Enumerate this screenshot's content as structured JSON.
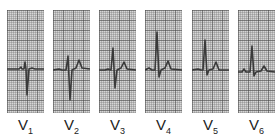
{
  "figure": {
    "leads": [
      {
        "id": "V1",
        "letter": "V",
        "number": "1",
        "x": 7,
        "trace": "M0 59 L12 59 L14 57 L15 59 L17 59 L18 52 L19 59 L20 85 L22 59 L25 58 L28 59 L37 59"
      },
      {
        "id": "V2",
        "letter": "V",
        "number": "2",
        "x": 53,
        "trace": "M0 60 L6 59 L9 60 L13 60 L15 46 L17 90 L19 60 L23 58 L26 50 L29 58 L37 59"
      },
      {
        "id": "V3",
        "letter": "V",
        "number": "3",
        "x": 99,
        "trace": "M0 60 L6 60 L9 59 L12 60 L14 38 L16 78 L18 60 L22 58 L25 52 L28 59 L37 60"
      },
      {
        "id": "V4",
        "letter": "V",
        "number": "4",
        "x": 145,
        "trace": "M0 60 L4 58 L7 60 L10 60 L12 22 L14 67 L16 60 L20 58 L23 51 L26 59 L37 60"
      },
      {
        "id": "V5",
        "letter": "V",
        "number": "5",
        "x": 192,
        "trace": "M0 60 L6 59 L9 60 L11 60 L13 30 L15 65 L17 60 L21 59 L24 52 L27 60 L37 60"
      },
      {
        "id": "V6",
        "letter": "V",
        "number": "6",
        "x": 238,
        "trace": "M0 62 L4 62 L6 59 L8 62 L12 62 L14 36 L16 66 L18 62 L23 61 L26 56 L29 61 L37 62"
      }
    ]
  }
}
